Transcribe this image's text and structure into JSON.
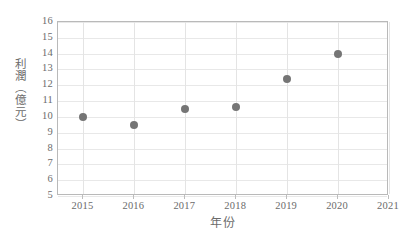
{
  "chart_data": {
    "type": "scatter",
    "title": "",
    "subtitle": "",
    "xlabel": "年份",
    "ylabel": "利潤（億元）",
    "x": [
      2015,
      2016,
      2017,
      2018,
      2019,
      2020
    ],
    "values": [
      10.0,
      9.5,
      10.5,
      10.6,
      12.4,
      14.0
    ],
    "series": [
      {
        "name": "利潤",
        "x": [
          2015,
          2016,
          2017,
          2018,
          2019,
          2020
        ],
        "values": [
          10.0,
          9.5,
          10.5,
          10.6,
          12.4,
          14.0
        ]
      }
    ],
    "xlim": [
      2014.5,
      2021.0
    ],
    "ylim": [
      5,
      16
    ],
    "xticks": [
      2015,
      2016,
      2017,
      2018,
      2019,
      2020,
      2021
    ],
    "xtick_labels": [
      "2015",
      "2016",
      "2017",
      "2018",
      "2019",
      "2020",
      "2021"
    ],
    "yticks": [
      5,
      6,
      7,
      8,
      9,
      10,
      11,
      12,
      13,
      14,
      15,
      16
    ],
    "ytick_labels": [
      "5",
      "6",
      "7",
      "8",
      "9",
      "10",
      "11",
      "12",
      "13",
      "14",
      "15",
      "16"
    ],
    "grid": true,
    "grid_axes": "both",
    "legend": false,
    "legend_position": "none",
    "marker": "circle",
    "marker_color": "#757575",
    "grid_color": "#e8e8e8",
    "frame_color": "#b9b9b9",
    "text_color": "#6b6b6b",
    "background_color": "#ffffff",
    "annotations": []
  }
}
